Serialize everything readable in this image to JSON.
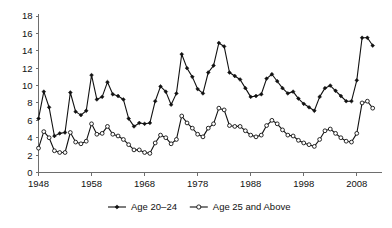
{
  "chart_data": {
    "type": "line",
    "title": "",
    "subtitle": "",
    "xlabel": "",
    "ylabel": "",
    "xlim": [
      1948,
      2012
    ],
    "ylim": [
      0,
      18
    ],
    "yticks": [
      0,
      2,
      4,
      6,
      8,
      10,
      12,
      14,
      16,
      18
    ],
    "xticks": [
      1948,
      1958,
      1968,
      1978,
      1988,
      1998,
      2008
    ],
    "ytick_labels": [
      "0",
      "2",
      "4",
      "6",
      "8",
      "10",
      "12",
      "14",
      "16",
      "18"
    ],
    "xtick_labels": [
      "1948",
      "1958",
      "1968",
      "1978",
      "1988",
      "1998",
      "2008"
    ],
    "grid": false,
    "legend_position": "bottom",
    "x": [
      1948,
      1949,
      1950,
      1951,
      1952,
      1953,
      1954,
      1955,
      1956,
      1957,
      1958,
      1959,
      1960,
      1961,
      1962,
      1963,
      1964,
      1965,
      1966,
      1967,
      1968,
      1969,
      1970,
      1971,
      1972,
      1973,
      1974,
      1975,
      1976,
      1977,
      1978,
      1979,
      1980,
      1981,
      1982,
      1983,
      1984,
      1985,
      1986,
      1987,
      1988,
      1989,
      1990,
      1991,
      1992,
      1993,
      1994,
      1995,
      1996,
      1997,
      1998,
      1999,
      2000,
      2001,
      2002,
      2003,
      2004,
      2005,
      2006,
      2007,
      2008,
      2009,
      2010,
      2011
    ],
    "series": [
      {
        "name": "Age 20–24",
        "marker": "filled-diamond",
        "values": [
          6.2,
          9.3,
          7.5,
          4.2,
          4.5,
          4.6,
          9.2,
          7.0,
          6.6,
          7.1,
          11.2,
          8.4,
          8.7,
          10.4,
          9.0,
          8.8,
          8.4,
          6.2,
          5.3,
          5.7,
          5.6,
          5.7,
          8.2,
          9.9,
          9.3,
          7.8,
          9.1,
          13.6,
          12.0,
          11.0,
          9.6,
          9.1,
          11.5,
          12.3,
          14.9,
          14.5,
          11.5,
          11.1,
          10.7,
          9.7,
          8.7,
          8.8,
          9.0,
          10.8,
          11.3,
          10.5,
          9.7,
          9.1,
          9.3,
          8.5,
          7.9,
          7.5,
          7.1,
          8.7,
          9.7,
          10.0,
          9.4,
          8.8,
          8.2,
          8.2,
          10.6,
          15.5,
          15.5,
          14.6
        ],
        "color": "#111111"
      },
      {
        "name": "Age 25 and Above",
        "marker": "open-circle",
        "values": [
          2.8,
          4.7,
          4.0,
          2.5,
          2.3,
          2.3,
          4.6,
          3.5,
          3.3,
          3.6,
          5.6,
          4.4,
          4.5,
          5.3,
          4.4,
          4.2,
          3.8,
          3.2,
          2.6,
          2.6,
          2.3,
          2.2,
          3.4,
          4.3,
          4.0,
          3.3,
          3.8,
          6.5,
          5.7,
          5.1,
          4.4,
          4.1,
          5.1,
          5.6,
          7.4,
          7.2,
          5.4,
          5.3,
          5.3,
          4.8,
          4.3,
          4.1,
          4.3,
          5.4,
          6.0,
          5.6,
          4.9,
          4.3,
          4.2,
          3.7,
          3.4,
          3.2,
          3.0,
          3.8,
          4.8,
          5.0,
          4.5,
          4.0,
          3.6,
          3.5,
          4.5,
          8.0,
          8.2,
          7.4
        ],
        "color": "#111111"
      }
    ],
    "legend": [
      {
        "label": "Age 20–24",
        "marker": "filled-diamond"
      },
      {
        "label": "Age 25 and Above",
        "marker": "open-circle"
      }
    ],
    "axis_color": "#6e6e6e",
    "line_color": "#111111",
    "background": "#ffffff"
  }
}
